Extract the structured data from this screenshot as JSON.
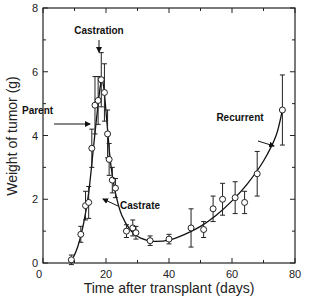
{
  "chart_data": {
    "type": "line",
    "title": "",
    "xlabel": "Time after transplant (days)",
    "ylabel": "Weight of tumor (g)",
    "xlim": [
      0,
      80
    ],
    "ylim": [
      0,
      8
    ],
    "xticks": [
      0,
      20,
      40,
      60,
      80
    ],
    "xminor": [
      10,
      30,
      50,
      70
    ],
    "yticks": [
      0,
      2,
      4,
      6,
      8
    ],
    "yminor": [
      1,
      3,
      5,
      7
    ],
    "grid": false,
    "legend": null,
    "series": [
      {
        "name": "Tumor weight",
        "marker": "open-circle",
        "x": [
          9,
          12,
          13.5,
          14.5,
          15.5,
          16.5,
          17.5,
          18.5,
          19.5,
          20.5,
          21,
          22,
          23,
          26.5,
          28.5,
          29.5,
          34,
          40,
          47,
          51,
          54,
          57,
          61,
          64,
          68,
          76
        ],
        "y": [
          0.1,
          0.9,
          1.8,
          1.9,
          3.6,
          4.95,
          5.1,
          5.75,
          5.35,
          4.05,
          3.25,
          2.6,
          2.35,
          1.0,
          1.1,
          0.95,
          0.7,
          0.75,
          1.1,
          1.05,
          1.7,
          2.0,
          2.05,
          1.9,
          2.8,
          4.8
        ],
        "err": [
          0.15,
          0.25,
          0.45,
          0.5,
          0.6,
          0.9,
          0.75,
          0.85,
          0.9,
          0.75,
          0.5,
          0.4,
          0.3,
          0.2,
          0.25,
          0.2,
          0.15,
          0.15,
          0.6,
          0.25,
          0.4,
          0.5,
          0.5,
          0.35,
          0.7,
          1.1
        ]
      }
    ],
    "annotations": [
      {
        "text": "Castration",
        "x": 18,
        "y": 6.9,
        "arrow_to": [
          18,
          6.3
        ]
      },
      {
        "text": "Parent",
        "x": 7,
        "y": 4.8,
        "arrow_to": [
          15.5,
          4.35
        ]
      },
      {
        "text": "Castrate",
        "x": 30,
        "y": 2.0,
        "arrow_to": [
          23.5,
          2.1
        ]
      },
      {
        "text": "Recurrent",
        "x": 70,
        "y": 4.3,
        "arrow_to": [
          74.5,
          3.6
        ]
      }
    ]
  }
}
